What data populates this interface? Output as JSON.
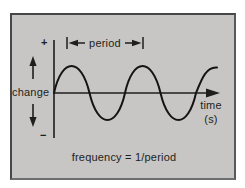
{
  "diagram": {
    "kind": "sine-wave-period-diagram",
    "y_axis": {
      "label": "change",
      "positive_sign": "+",
      "negative_sign": "−"
    },
    "x_axis": {
      "label_line1": "time",
      "label_line2": "(s)"
    },
    "period_annotation": {
      "label": "period"
    },
    "caption": "frequency = 1/period",
    "wave": {
      "type": "sine",
      "cycles_visible": 2.3,
      "starts_at_origin": true,
      "oscillates_about": "time axis"
    },
    "colors": {
      "panel_background": "#c7c6c4",
      "frame_border": "#474747",
      "ink": "#1e1e1c",
      "page_background": "#ffffff"
    }
  }
}
